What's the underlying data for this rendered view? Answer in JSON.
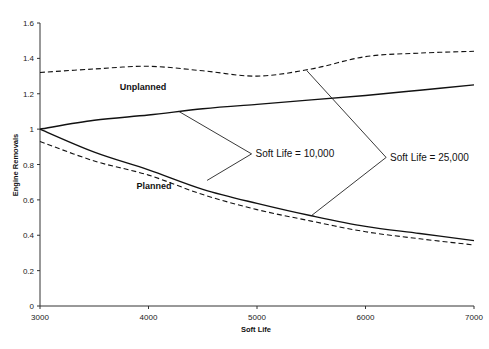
{
  "chart_data": {
    "type": "line",
    "title": "",
    "xlabel": "Soft Life",
    "ylabel": "Engine Removals",
    "xlim": [
      3000,
      7000
    ],
    "ylim": [
      0,
      1.6
    ],
    "x_ticks": [
      3000,
      4000,
      5000,
      6000,
      7000
    ],
    "x_tick_labels": [
      "3000",
      "4000",
      "5000",
      "6000",
      "7000"
    ],
    "y_ticks": [
      0,
      0.2,
      0.4,
      0.6,
      0.8,
      1.0,
      1.2,
      1.4,
      1.6
    ],
    "y_tick_labels": [
      "0",
      "0.2",
      "0.4",
      "0.6",
      "0.8",
      "1",
      "1.2",
      "1.4",
      "1.6"
    ],
    "grid": false,
    "legend": "none",
    "x": [
      3000,
      3500,
      4000,
      4500,
      5000,
      5500,
      6000,
      6500,
      7000
    ],
    "series": [
      {
        "name": "Unplanned, Soft Life = 25,000",
        "style": "dashed",
        "values": [
          1.32,
          1.34,
          1.355,
          1.33,
          1.3,
          1.34,
          1.41,
          1.43,
          1.44
        ]
      },
      {
        "name": "Unplanned, Soft Life = 10,000",
        "style": "solid",
        "values": [
          1.0,
          1.05,
          1.08,
          1.115,
          1.14,
          1.165,
          1.19,
          1.22,
          1.25
        ]
      },
      {
        "name": "Planned, Soft Life = 10,000",
        "style": "solid",
        "values": [
          1.0,
          0.87,
          0.77,
          0.66,
          0.58,
          0.51,
          0.45,
          0.41,
          0.37
        ]
      },
      {
        "name": "Planned, Soft Life = 25,000",
        "style": "dashed",
        "values": [
          0.93,
          0.82,
          0.74,
          0.63,
          0.545,
          0.48,
          0.42,
          0.38,
          0.345
        ]
      }
    ],
    "annotations": [
      {
        "text": "Unplanned",
        "type": "region-label",
        "x": 3950,
        "y": 1.22
      },
      {
        "text": "Planned",
        "type": "region-label",
        "x": 4050,
        "y": 0.66
      },
      {
        "text": "Soft Life = 10,000",
        "type": "callout",
        "x": 4950,
        "y": 0.86,
        "vertex": [
          4950,
          0.86
        ],
        "points_to": [
          [
            4280,
            1.1
          ],
          [
            4540,
            0.71
          ]
        ]
      },
      {
        "text": "Soft Life = 25,000",
        "type": "callout",
        "x": 6190,
        "y": 0.84,
        "vertex": [
          6190,
          0.84
        ],
        "points_to": [
          [
            5460,
            1.33
          ],
          [
            5500,
            0.51
          ]
        ]
      }
    ]
  }
}
